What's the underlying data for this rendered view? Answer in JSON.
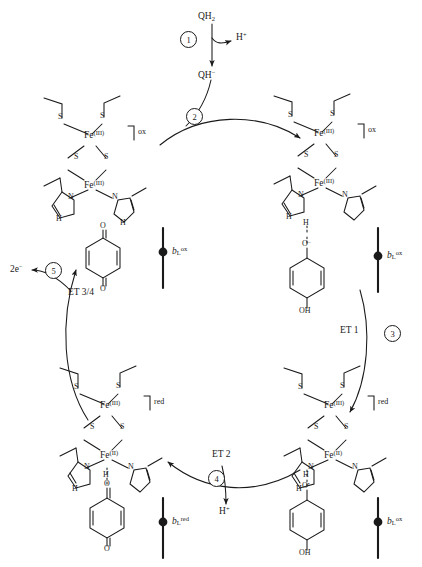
{
  "diagram": {
    "substrate_top": "QH",
    "substrate_top_sub": "2",
    "proton": "H",
    "proton_sup": "+",
    "quinolate": "QH",
    "quinolate_sup": "−",
    "electrons_out": "2e",
    "electrons_out_sup": "−"
  },
  "steps": [
    {
      "id": "1",
      "label": "1"
    },
    {
      "id": "2",
      "label": "2"
    },
    {
      "id": "3",
      "label": "3"
    },
    {
      "id": "4",
      "label": "4"
    },
    {
      "id": "5",
      "label": "5"
    }
  ],
  "et_labels": [
    {
      "name": "et-1",
      "text": "ET 1"
    },
    {
      "name": "et-2",
      "text": "ET 2"
    },
    {
      "name": "et-3-4",
      "text": "ET 3/4"
    }
  ],
  "clusters": [
    {
      "position": "top-left",
      "state": "ox",
      "fe_top": "Fe",
      "fe_top_sup": "(III)",
      "fe_bottom": "Fe",
      "fe_bottom_sup": "(III)",
      "sulfur": "S",
      "nitrogen": "N",
      "nh": "H"
    },
    {
      "position": "top-right",
      "state": "ox",
      "fe_top": "Fe",
      "fe_top_sup": "(III)",
      "fe_bottom": "Fe",
      "fe_bottom_sup": "(III)",
      "sulfur": "S",
      "nitrogen": "N",
      "nh": "H"
    },
    {
      "position": "bottom-right",
      "state": "red",
      "fe_top": "Fe",
      "fe_top_sup": "(III)",
      "fe_bottom": "Fe",
      "fe_bottom_sup": "(II)",
      "sulfur": "S",
      "nitrogen": "N",
      "nh": "H"
    },
    {
      "position": "bottom-left",
      "state": "red",
      "fe_top": "Fe",
      "fe_top_sup": "(III)",
      "fe_bottom": "Fe",
      "fe_bottom_sup": "(II)",
      "sulfur": "S",
      "nitrogen": "N",
      "nh": "H"
    }
  ],
  "hemes": [
    {
      "position": "middle-left",
      "symbol": "b",
      "sub": "L",
      "sup": "ox"
    },
    {
      "position": "middle-right",
      "symbol": "b",
      "sub": "L",
      "sup": "ox"
    },
    {
      "position": "bottom-left",
      "symbol": "b",
      "sub": "L",
      "sup": "red"
    },
    {
      "position": "bottom-right",
      "symbol": "b",
      "sub": "L",
      "sup": "ox"
    }
  ],
  "quinone_species": [
    {
      "position": "middle-left",
      "top_atom": "O",
      "bottom_atom": "O",
      "type": "quinone"
    },
    {
      "position": "middle-right",
      "top_atom": "O",
      "top_sup": "−",
      "bottom_atom": "OH",
      "type": "quinolate"
    },
    {
      "position": "bottom-right",
      "top_atom": "O",
      "top_sup": "•",
      "bottom_atom": "OH",
      "type": "semiquinone"
    },
    {
      "position": "bottom-left",
      "top_atom": "O",
      "bottom_atom": "O",
      "type": "quinone"
    }
  ],
  "colors": {
    "ink": "#1a1a1a",
    "background": "#ffffff"
  }
}
